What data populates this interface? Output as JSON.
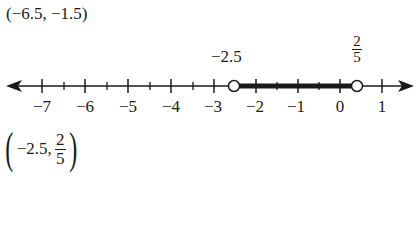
{
  "problem": {
    "interval_a": "(−6.5, −1.5)",
    "interval_b": {
      "open": "(",
      "left": "−2.5,",
      "right_num": "2",
      "right_den": "5",
      "close": ")"
    }
  },
  "number_line": {
    "min": -7,
    "max": 1,
    "tick_labels": [
      "−7",
      "−6",
      "−5",
      "−4",
      "−3",
      "−2",
      "−1",
      "0",
      "1"
    ],
    "endpoint_left_label": "−2.5",
    "endpoint_right_num": "2",
    "endpoint_right_den": "5",
    "endpoint_left_value": -2.5,
    "endpoint_right_value": 0.4,
    "endpoint_style": "open",
    "line_color": "#1a1a1a"
  }
}
